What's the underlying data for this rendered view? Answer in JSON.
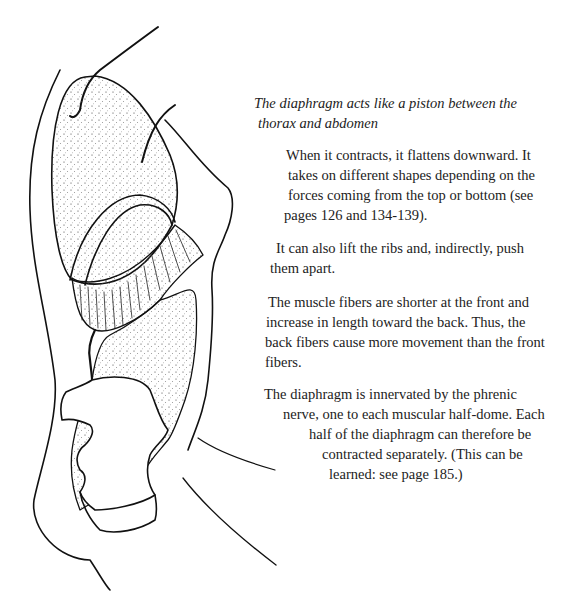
{
  "figure": {
    "icon": "diaphragm-illustration"
  },
  "caption": {
    "lines": [
      "The diaphragm acts like a piston between the",
      "thorax and abdomen"
    ]
  },
  "paragraphs": [
    {
      "lines": [
        "When it contracts, it flattens downward. It",
        "takes on different shapes depending on the",
        "forces coming from the top or bottom (see",
        "pages 126 and 134-139)."
      ]
    },
    {
      "lines": [
        "It can also lift the ribs and, indirectly, push",
        "them apart."
      ]
    },
    {
      "lines": [
        "The muscle fibers are shorter at the front and",
        "increase in length toward the back. Thus, the",
        "back fibers cause more movement than the front",
        "fibers."
      ]
    },
    {
      "lines": [
        "The diaphragm is innervated by the phrenic",
        "nerve, one to each muscular half-dome. Each",
        "half of the diaphragm can therefore be",
        "contracted separately. (This can be",
        "learned: see page 185.)"
      ]
    }
  ]
}
